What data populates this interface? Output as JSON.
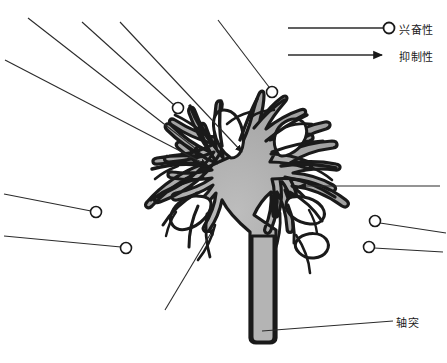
{
  "figure": {
    "width": 447,
    "height": 363,
    "background": "#ffffff"
  },
  "colors": {
    "soma_fill": "#a8a8a8",
    "soma_fill_light": "#c9c9c9",
    "outline": "#1a1a1a",
    "interior_white": "#ffffff",
    "leader_line": "#2b2b2b",
    "text": "#1a1a1a"
  },
  "legend": {
    "position": "top-right",
    "items": [
      {
        "id": "excitatory",
        "label": "兴奋性",
        "terminal": "open-circle",
        "marker_name": "open-circle-terminal",
        "line_x1": 288,
        "line_x2": 383,
        "line_y": 28,
        "circle_cx": 389,
        "circle_cy": 28,
        "circle_r": 5.5
      },
      {
        "id": "inhibitory",
        "label": "抑制性",
        "terminal": "solid-arrowhead",
        "marker_name": "solid-arrow-terminal",
        "line_x1": 288,
        "line_x2": 380,
        "line_y": 55,
        "arrow_tip_x": 394,
        "arrow_tip_y": 55
      }
    ]
  },
  "annotations": {
    "axon": {
      "label": "轴突",
      "leader_x1": 393,
      "leader_y1": 321,
      "leader_x2": 262,
      "leader_y2": 331,
      "target": "axon-shaft"
    }
  },
  "neuron": {
    "name": "multipolar-neuron",
    "soma_center_x": 238,
    "soma_center_y": 195,
    "axon": {
      "name": "axon-shaft",
      "top_y": 230,
      "bottom_y": 340,
      "x": 258,
      "width": 18
    },
    "dendrite_count": 8,
    "description": "Gray cell body with radiating branched dendrites and a descending axon"
  },
  "inhibitory_arrows": [
    {
      "id": "arrow-upper-left-1",
      "x1": 28,
      "y1": 18,
      "x2": 200,
      "y2": 152,
      "name": "inhibitory-arrow-upper-left-outer"
    },
    {
      "id": "arrow-upper-left-2",
      "x1": 5,
      "y1": 60,
      "x2": 207,
      "y2": 165,
      "name": "inhibitory-arrow-upper-left-inner"
    },
    {
      "id": "arrow-top-center",
      "x1": 120,
      "y1": 22,
      "x2": 242,
      "y2": 152,
      "name": "inhibitory-arrow-top-center"
    },
    {
      "id": "arrow-right",
      "x1": 440,
      "y1": 186,
      "x2": 299,
      "y2": 186,
      "name": "inhibitory-arrow-right"
    },
    {
      "id": "arrow-bottom-left",
      "x1": 165,
      "y1": 310,
      "x2": 214,
      "y2": 228,
      "name": "inhibitory-arrow-bottom-left"
    }
  ],
  "excitatory_terminals": [
    {
      "id": "circle-top-inner-left",
      "cx": 178,
      "cy": 108,
      "r": 5.5,
      "line_x2": 82,
      "line_y2": 22,
      "name": "excitatory-terminal-top-left"
    },
    {
      "id": "circle-top-right",
      "cx": 272,
      "cy": 92,
      "r": 5.5,
      "line_x2": 218,
      "line_y2": 20,
      "name": "excitatory-terminal-top-right"
    },
    {
      "id": "circle-left-upper",
      "cx": 96,
      "cy": 212,
      "r": 5.5,
      "line_x2": 4,
      "line_y2": 194,
      "name": "excitatory-terminal-left-upper"
    },
    {
      "id": "circle-left-lower",
      "cx": 126,
      "cy": 248,
      "r": 5.5,
      "line_x2": 4,
      "line_y2": 236,
      "name": "excitatory-terminal-left-lower"
    },
    {
      "id": "circle-right-upper",
      "cx": 375,
      "cy": 221,
      "r": 5.5,
      "line_x2": 446,
      "line_y2": 233,
      "name": "excitatory-terminal-right-upper"
    },
    {
      "id": "circle-right-lower",
      "cx": 369,
      "cy": 247,
      "r": 5.5,
      "line_x2": 443,
      "line_y2": 252,
      "name": "excitatory-terminal-right-lower"
    }
  ]
}
